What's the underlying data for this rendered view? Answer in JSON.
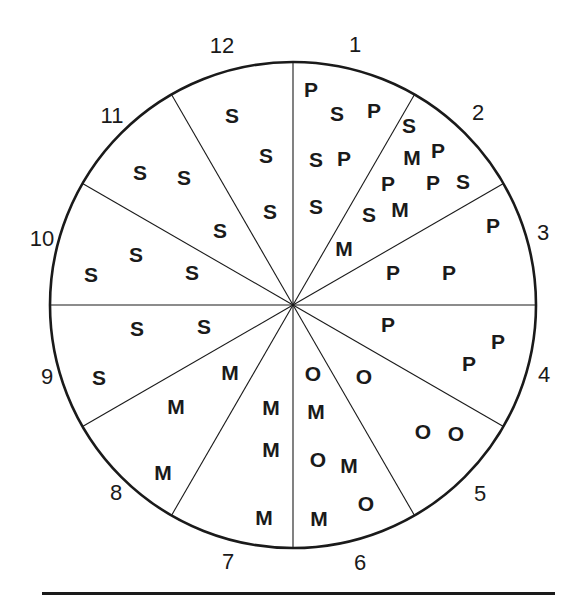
{
  "figure": {
    "type": "clock-sector-diagram",
    "background_color": "#ffffff",
    "line_color": "#1a1a1a",
    "circle": {
      "cx": 293,
      "cy": 305,
      "r": 243
    },
    "hour_labels": [
      {
        "text": "12",
        "x": 222,
        "y": 46
      },
      {
        "text": "1",
        "x": 355,
        "y": 45
      },
      {
        "text": "2",
        "x": 478,
        "y": 113
      },
      {
        "text": "3",
        "x": 543,
        "y": 233
      },
      {
        "text": "4",
        "x": 544,
        "y": 375
      },
      {
        "text": "5",
        "x": 480,
        "y": 494
      },
      {
        "text": "6",
        "x": 360,
        "y": 563
      },
      {
        "text": "7",
        "x": 228,
        "y": 562
      },
      {
        "text": "8",
        "x": 116,
        "y": 493
      },
      {
        "text": "9",
        "x": 47,
        "y": 377
      },
      {
        "text": "10",
        "x": 42,
        "y": 239
      },
      {
        "text": "11",
        "x": 112,
        "y": 116
      }
    ],
    "sector_dividers_deg": [
      0,
      30,
      60,
      90,
      120,
      150,
      180,
      210,
      240,
      270,
      300,
      330
    ],
    "letters": [
      {
        "text": "P",
        "x": 311,
        "y": 89
      },
      {
        "text": "S",
        "x": 337,
        "y": 113
      },
      {
        "text": "P",
        "x": 374,
        "y": 110
      },
      {
        "text": "S",
        "x": 409,
        "y": 125
      },
      {
        "text": "S",
        "x": 316,
        "y": 159
      },
      {
        "text": "P",
        "x": 344,
        "y": 158
      },
      {
        "text": "M",
        "x": 412,
        "y": 157
      },
      {
        "text": "P",
        "x": 438,
        "y": 150
      },
      {
        "text": "P",
        "x": 388,
        "y": 183
      },
      {
        "text": "P",
        "x": 433,
        "y": 182
      },
      {
        "text": "S",
        "x": 463,
        "y": 181
      },
      {
        "text": "S",
        "x": 316,
        "y": 206
      },
      {
        "text": "S",
        "x": 369,
        "y": 214
      },
      {
        "text": "M",
        "x": 400,
        "y": 209
      },
      {
        "text": "P",
        "x": 493,
        "y": 225
      },
      {
        "text": "M",
        "x": 344,
        "y": 248
      },
      {
        "text": "P",
        "x": 393,
        "y": 272
      },
      {
        "text": "P",
        "x": 449,
        "y": 272
      },
      {
        "text": "P",
        "x": 388,
        "y": 324
      },
      {
        "text": "P",
        "x": 498,
        "y": 341
      },
      {
        "text": "P",
        "x": 469,
        "y": 363
      },
      {
        "text": "O",
        "x": 313,
        "y": 373
      },
      {
        "text": "O",
        "x": 364,
        "y": 376
      },
      {
        "text": "O",
        "x": 423,
        "y": 431
      },
      {
        "text": "O",
        "x": 456,
        "y": 433
      },
      {
        "text": "M",
        "x": 316,
        "y": 411
      },
      {
        "text": "M",
        "x": 271,
        "y": 407
      },
      {
        "text": "O",
        "x": 318,
        "y": 459
      },
      {
        "text": "M",
        "x": 349,
        "y": 465
      },
      {
        "text": "O",
        "x": 366,
        "y": 503
      },
      {
        "text": "M",
        "x": 319,
        "y": 518
      },
      {
        "text": "M",
        "x": 264,
        "y": 517
      },
      {
        "text": "M",
        "x": 271,
        "y": 449
      },
      {
        "text": "M",
        "x": 230,
        "y": 372
      },
      {
        "text": "M",
        "x": 176,
        "y": 406
      },
      {
        "text": "M",
        "x": 163,
        "y": 472
      },
      {
        "text": "S",
        "x": 137,
        "y": 328
      },
      {
        "text": "S",
        "x": 204,
        "y": 326
      },
      {
        "text": "S",
        "x": 99,
        "y": 377
      },
      {
        "text": "S",
        "x": 91,
        "y": 274
      },
      {
        "text": "S",
        "x": 136,
        "y": 254
      },
      {
        "text": "S",
        "x": 192,
        "y": 272
      },
      {
        "text": "S",
        "x": 140,
        "y": 172
      },
      {
        "text": "S",
        "x": 184,
        "y": 177
      },
      {
        "text": "S",
        "x": 220,
        "y": 230
      },
      {
        "text": "S",
        "x": 232,
        "y": 115
      },
      {
        "text": "S",
        "x": 266,
        "y": 155
      },
      {
        "text": "S",
        "x": 270,
        "y": 211
      }
    ],
    "bottom_rule": {
      "x": 42,
      "y": 592,
      "width": 513,
      "height": 3
    }
  }
}
